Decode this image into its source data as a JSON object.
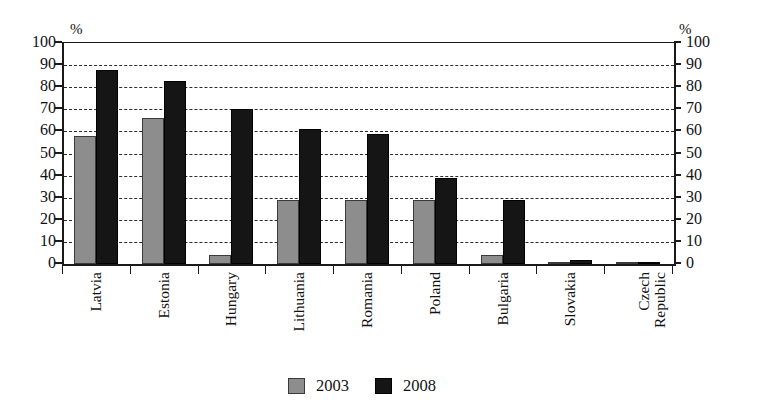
{
  "chart_data": {
    "type": "bar",
    "title": "",
    "subtitle": "",
    "xlabel": "",
    "ylabel": "%",
    "ylabel_right": "%",
    "ylim": [
      0,
      100
    ],
    "ytick_step": 10,
    "yticks": [
      0,
      10,
      20,
      30,
      40,
      50,
      60,
      70,
      80,
      90,
      100
    ],
    "ytick_labels": [
      "0",
      "10",
      "20",
      "30",
      "40",
      "50",
      "60",
      "70",
      "80",
      "90",
      "100"
    ],
    "grid": true,
    "grid_style": "dashed-horizontal",
    "dual_axis": true,
    "legend_position": "bottom-center",
    "categories": [
      "Latvia",
      "Estonia",
      "Hungary",
      "Lithuania",
      "Romania",
      "Poland",
      "Bulgaria",
      "Slovakia",
      "Czech Republic"
    ],
    "category_label_lines": [
      [
        "Latvia"
      ],
      [
        "Estonia"
      ],
      [
        "Hungary"
      ],
      [
        "Lithuania"
      ],
      [
        "Romania"
      ],
      [
        "Poland"
      ],
      [
        "Bulgaria"
      ],
      [
        "Slovakia"
      ],
      [
        "Czech",
        "Republic"
      ]
    ],
    "series": [
      {
        "name": "2003",
        "color": "#8d8d8d",
        "values": [
          58,
          66,
          4,
          29,
          29,
          29,
          4,
          0.4,
          0.3
        ]
      },
      {
        "name": "2008",
        "color": "#151515",
        "values": [
          88,
          83,
          70,
          61,
          59,
          39,
          29,
          2,
          0.4
        ]
      }
    ]
  },
  "legend": {
    "entries": [
      {
        "label": "2003",
        "swatch": "gray-square"
      },
      {
        "label": "2008",
        "swatch": "black-square"
      }
    ]
  },
  "axes": {
    "left_unit": "%",
    "right_unit": "%"
  }
}
